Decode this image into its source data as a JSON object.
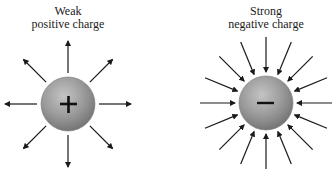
{
  "diagram": {
    "positive_charge": {
      "label_line1": "Weak",
      "label_line2": "positive charge",
      "symbol": "+",
      "field_direction": "outward",
      "arrow_count": 8
    },
    "negative_charge": {
      "label_line1": "Strong",
      "label_line2": "negative charge",
      "symbol": "−",
      "field_direction": "inward",
      "arrow_count": 16
    }
  }
}
